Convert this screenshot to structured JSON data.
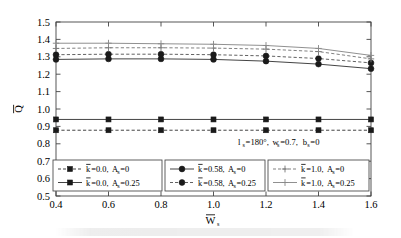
{
  "chart_data": {
    "type": "line",
    "title": "",
    "xlabel": "W̅s",
    "ylabel": "Q̅",
    "xlim": [
      0.4,
      1.6
    ],
    "ylim": [
      0.5,
      1.5
    ],
    "grid": false,
    "legend_position": "inside-bottom",
    "x": [
      0.4,
      0.6,
      0.8,
      1.0,
      1.2,
      1.4,
      1.6
    ],
    "xticklabels": [
      "0.4",
      "0.6",
      "0.8",
      "1.0",
      "1.2",
      "1.4",
      "1.6"
    ],
    "yticklabels": [
      "0.5",
      "0.6",
      "0.7",
      "0.8",
      "0.9",
      "1.0",
      "1.1",
      "1.2",
      "1.3",
      "1.4",
      "1.5"
    ],
    "annotation": "ls=180°,ws=0.7,bs=0",
    "series": [
      {
        "name": "k̅=0.0, As=0",
        "marker": "square",
        "linestyle": "dashed",
        "color": "#3a3a3a",
        "values": [
          0.878,
          0.878,
          0.878,
          0.878,
          0.878,
          0.878,
          0.878
        ]
      },
      {
        "name": "k̅=0.0, As=0.25",
        "marker": "square",
        "linestyle": "solid",
        "color": "#3a3a3a",
        "values": [
          0.94,
          0.94,
          0.94,
          0.94,
          0.94,
          0.94,
          0.94
        ]
      },
      {
        "name": "k̅=0.58, As=0",
        "marker": "circle",
        "linestyle": "solid",
        "color": "#3a3a3a",
        "values": [
          1.285,
          1.288,
          1.288,
          1.285,
          1.275,
          1.258,
          1.232
        ]
      },
      {
        "name": "k̅=0.58, As=0.25",
        "marker": "circle",
        "linestyle": "dashed",
        "color": "#5a5a5a",
        "values": [
          1.312,
          1.315,
          1.315,
          1.312,
          1.305,
          1.29,
          1.265
        ]
      },
      {
        "name": "k̅=1.0, As=0",
        "marker": "plus",
        "linestyle": "dashed",
        "color": "#7a7a7a",
        "values": [
          1.348,
          1.352,
          1.352,
          1.35,
          1.344,
          1.33,
          1.288
        ]
      },
      {
        "name": "k̅=1.0, As=0.25",
        "marker": "plus",
        "linestyle": "solid",
        "color": "#8a8a8a",
        "values": [
          1.378,
          1.378,
          1.375,
          1.372,
          1.365,
          1.348,
          1.308
        ]
      }
    ]
  },
  "axes": {
    "ylabel_main": "Q",
    "xlabel_main": "W",
    "xlabel_sub": "s"
  },
  "annotation": {
    "l_sym": "l",
    "l_sub": "s",
    "l_val": "=180°,",
    "w_sym": "w",
    "w_sub": "s",
    "w_val": "=0.7,",
    "b_sym": "b",
    "b_sub": "s",
    "b_val": "=0"
  },
  "legend": {
    "groups": [
      {
        "id": "group-k0",
        "entries": [
          {
            "k_sym": "k",
            "eq": "=0.0,",
            "a_sym": "A",
            "a_sub": "s",
            "a_val": "=0",
            "style": "dashed",
            "marker": "square"
          },
          {
            "k_sym": "k",
            "eq": "=0.0,",
            "a_sym": "A",
            "a_sub": "s",
            "a_val": "=0.25",
            "style": "solid",
            "marker": "square"
          }
        ]
      },
      {
        "id": "group-k058",
        "entries": [
          {
            "k_sym": "k",
            "eq": "=0.58,",
            "a_sym": "A",
            "a_sub": "s",
            "a_val": "=0",
            "style": "solid",
            "marker": "circle"
          },
          {
            "k_sym": "k",
            "eq": "=0.58,",
            "a_sym": "A",
            "a_sub": "s",
            "a_val": "=0.25",
            "style": "dashed",
            "marker": "circle"
          }
        ]
      },
      {
        "id": "group-k1",
        "entries": [
          {
            "k_sym": "k",
            "eq": "=1.0,",
            "a_sym": "A",
            "a_sub": "s",
            "a_val": "=0",
            "style": "dashed",
            "marker": "plus"
          },
          {
            "k_sym": "k",
            "eq": "=1.0,",
            "a_sym": "A",
            "a_sub": "s",
            "a_val": "=0.25",
            "style": "solid",
            "marker": "plus"
          }
        ]
      }
    ]
  }
}
